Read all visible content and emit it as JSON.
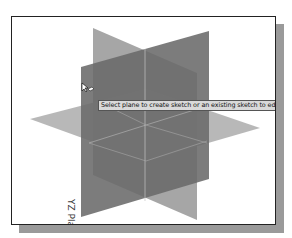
{
  "viewport": {
    "tooltip": "Select plane to create sketch or an existing sketch to edit",
    "plane_label": "YZ Plane",
    "cursor_icon": "select-plane-cursor-icon"
  },
  "colors": {
    "frame_border": "#222222",
    "shadow": "#9a9a9a",
    "plane_dark": "#6e6e6e",
    "plane_mid": "#8c8c8c",
    "plane_light": "#b3b3b3",
    "edge_lines": "#c8c8c8",
    "tooltip_bg": "#d9d9d9"
  }
}
